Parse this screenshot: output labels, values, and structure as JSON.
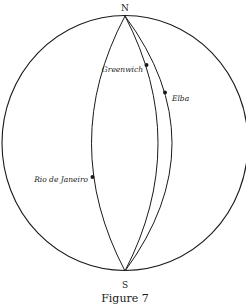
{
  "figure": {
    "caption": "Figure 7",
    "poles": {
      "north": "N",
      "south": "S"
    },
    "places": [
      {
        "name": "Greenwich",
        "meridian": "greenwich"
      },
      {
        "name": "Elba",
        "meridian": "elba"
      },
      {
        "name": "Rio de Janeiro",
        "meridian": "rio"
      }
    ],
    "colors": {
      "ink": "#1a1a1a",
      "background": "#ffffff"
    }
  }
}
